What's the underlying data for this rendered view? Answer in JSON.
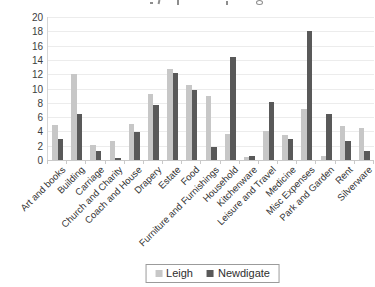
{
  "chart_data": {
    "type": "bar",
    "title": "",
    "categories": [
      "Art and books",
      "Building",
      "Carriage",
      "Church and Charity",
      "Coach and House",
      "Drapery",
      "Estate",
      "Food",
      "Furniture and Furnishings",
      "Household",
      "Kitchenware",
      "Leisure and Travel",
      "Medicine",
      "Misc Expenses",
      "Park and Garden",
      "Rent",
      "Silverware"
    ],
    "series": [
      {
        "name": "Leigh",
        "color": "#c7c7c7",
        "values": [
          4.9,
          12.0,
          2.1,
          2.6,
          5.1,
          9.2,
          12.7,
          10.5,
          9.0,
          3.7,
          0.4,
          4.1,
          3.5,
          7.2,
          0.6,
          4.8,
          4.5
        ]
      },
      {
        "name": "Newdigate",
        "color": "#595959",
        "values": [
          2.9,
          6.4,
          1.3,
          0.3,
          3.9,
          7.7,
          12.2,
          9.8,
          1.8,
          14.4,
          0.6,
          8.1,
          2.9,
          18.0,
          6.4,
          2.6,
          1.3
        ]
      }
    ],
    "xlabel": "",
    "ylabel": "",
    "ylim": [
      0,
      20
    ],
    "yticks": [
      0,
      2,
      4,
      6,
      8,
      10,
      12,
      14,
      16,
      18,
      20
    ],
    "grid": true,
    "legend_position": "bottom"
  },
  "colors": {
    "background": "#ffffff",
    "gridline": "#ececec",
    "axis": "#c9c9c9",
    "tick_label": "#3d3d3d",
    "category_label": "#333333",
    "legend_border": "#9b9b9b"
  }
}
